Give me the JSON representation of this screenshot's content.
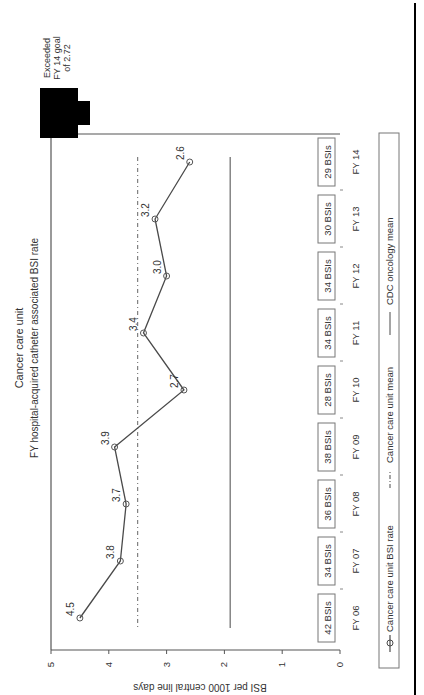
{
  "chart_data": {
    "type": "line",
    "orientation": "rotated-90-ccw",
    "title": "Cancer care unit",
    "subtitle": "FY hospital-acquired catheter associated BSI rate",
    "xlabel": "",
    "ylabel": "BSI per 1000 central line days",
    "ylim": [
      0,
      5
    ],
    "yticks": [
      0,
      1,
      2,
      3,
      4,
      5
    ],
    "grid": false,
    "categories": [
      "FY 06",
      "FY 07",
      "FY 08",
      "FY 09",
      "FY 10",
      "FY 11",
      "FY 12",
      "FY 13",
      "FY 14"
    ],
    "series": [
      {
        "name": "Cancer care unit BSI rate",
        "style": "solid line with open circle markers",
        "values": [
          4.5,
          3.8,
          3.7,
          3.9,
          2.7,
          3.4,
          3.0,
          3.2,
          2.6
        ],
        "labels": [
          "4.5",
          "3.8",
          "3.7",
          "3.9",
          "2.7",
          "3.4",
          "3.0",
          "3.2",
          "2.6"
        ]
      },
      {
        "name": "Cancer care unit mean",
        "style": "dash-dot line",
        "values": [
          3.5,
          3.5,
          3.5,
          3.5,
          3.5,
          3.5,
          3.5,
          3.5,
          3.5
        ]
      },
      {
        "name": "CDC oncology mean",
        "style": "solid line",
        "values": [
          1.9,
          1.9,
          1.9,
          1.9,
          1.9,
          1.9,
          1.9,
          1.9,
          1.9
        ]
      }
    ],
    "bsi_counts": [
      "42 BSIs",
      "34 BSIs",
      "36 BSIs",
      "38 BSIs",
      "28 BSIs",
      "34 BSIs",
      "34 BSIs",
      "30 BSIs",
      "29 BSIs"
    ],
    "annotation": {
      "lines": [
        "Exceeded",
        "FY 14 goal",
        "of 2.72"
      ],
      "target": "FY 14",
      "marker": "down-arrow"
    },
    "legend": {
      "position": "bottom",
      "entries": [
        "Cancer care unit BSI rate",
        "Cancer care unit mean",
        "CDC oncology mean"
      ]
    }
  },
  "colors": {
    "line": "#4a4a4a",
    "axis": "#555555",
    "text": "#333333",
    "arrow": "#000000",
    "border": "#000000"
  }
}
